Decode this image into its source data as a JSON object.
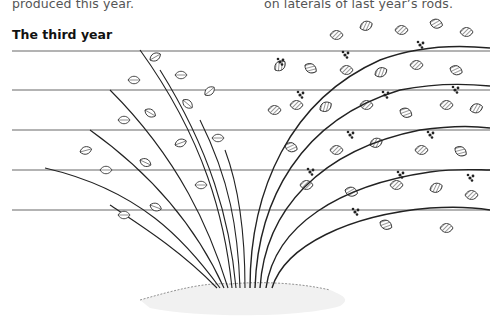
{
  "text": {
    "caption_left_tail": "produced this year.",
    "caption_right_tail": "on laterals of last year’s rods.",
    "section_heading": "The third year"
  },
  "illustration": {
    "subject": "bramble-canes-trained-on-wires",
    "wire_count": 5,
    "wire_y": [
      51,
      90,
      130,
      170,
      210
    ],
    "colors": {
      "ink": "#222222",
      "wire": "#9a9a9a",
      "soil": "#bbbbbb"
    }
  }
}
